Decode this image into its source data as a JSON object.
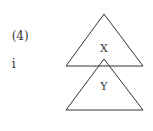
{
  "question": {
    "number": "(4)",
    "option": "i"
  },
  "diagram": {
    "colors": {
      "stroke": "#333333",
      "background": "#ffffff"
    },
    "triangles": [
      {
        "id": "top",
        "label": "X",
        "apex": [
          104,
          14
        ],
        "base_left": [
          66,
          66
        ],
        "base_right": [
          143,
          66
        ]
      },
      {
        "id": "bottom",
        "label": "Y",
        "apex": [
          104,
          59
        ],
        "base_left": [
          66,
          110
        ],
        "base_right": [
          143,
          110
        ]
      }
    ]
  }
}
